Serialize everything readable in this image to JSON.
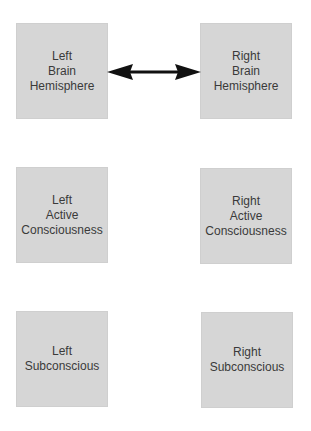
{
  "diagram": {
    "boxes": [
      {
        "id": "left-brain",
        "lines": [
          "Left",
          "Brain",
          "Hemisphere"
        ]
      },
      {
        "id": "right-brain",
        "lines": [
          "Right",
          "Brain",
          "Hemisphere"
        ]
      },
      {
        "id": "left-active",
        "lines": [
          "Left",
          "Active",
          "Consciousness"
        ]
      },
      {
        "id": "right-active",
        "lines": [
          "Right",
          "Active",
          "Consciousness"
        ]
      },
      {
        "id": "left-sub",
        "lines": [
          "Left",
          "Subconscious"
        ]
      },
      {
        "id": "right-sub",
        "lines": [
          "Right",
          "Subconscious"
        ]
      }
    ],
    "connectors": [
      {
        "from": "left-brain",
        "to": "right-brain",
        "type": "double-arrow"
      }
    ],
    "colors": {
      "box_fill": "#d6d6d6",
      "text": "#3a3a3a",
      "arrow": "#111111"
    }
  }
}
